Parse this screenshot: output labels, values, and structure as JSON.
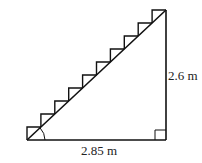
{
  "diagram": {
    "type": "staircase-right-triangle",
    "base_label": "2.85 m",
    "height_label": "2.6 m",
    "step_count": 10,
    "angle_marker": "base-angle-arc",
    "right_angle_marker": true,
    "stroke_color": "#111111"
  }
}
